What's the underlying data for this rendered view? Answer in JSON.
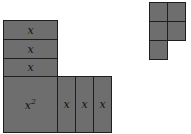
{
  "diagram": {
    "type": "algebra-tiles",
    "colors": {
      "tile_fill": "#6e6e6e",
      "tile_border": "#1e1e1e",
      "background": "#ffffff"
    },
    "x_squared_tile": {
      "label_base": "x",
      "label_exp": "2"
    },
    "horizontal_x_tiles": [
      {
        "label": "x"
      },
      {
        "label": "x"
      },
      {
        "label": "x"
      }
    ],
    "vertical_x_tiles": [
      {
        "label": "x"
      },
      {
        "label": "x"
      },
      {
        "label": "x"
      }
    ],
    "unit_tiles_count": 5
  }
}
